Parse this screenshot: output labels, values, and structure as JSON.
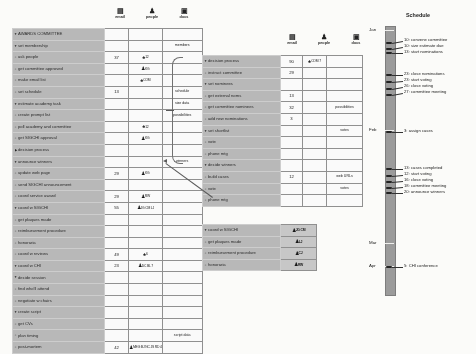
{
  "document": {
    "title": "AWARDS COMMITTEE project outline"
  },
  "columns": {
    "email": {
      "label": "email",
      "icon": "email-icon"
    },
    "people": {
      "label": "people",
      "icon": "people-icon"
    },
    "docs": {
      "label": "docs",
      "icon": "docs-icon"
    }
  },
  "main_panel": {
    "rows": [
      {
        "marker": "down",
        "indent": 0,
        "label": "AWARDS COMMITTEE",
        "email": "",
        "people": "",
        "docs": ""
      },
      {
        "marker": "down",
        "indent": 1,
        "label": "set membership",
        "email": "",
        "people": "",
        "docs": "members"
      },
      {
        "marker": "dot",
        "indent": 2,
        "label": "ask people",
        "email": "37",
        "people": "12",
        "people_icon": "group-icon",
        "docs": ""
      },
      {
        "marker": "dot",
        "indent": 2,
        "label": "get committee approved",
        "email": "",
        "people": "KG",
        "people_icon": "person-icon",
        "docs": ""
      },
      {
        "marker": "dot",
        "indent": 2,
        "label": "make email list",
        "email": "",
        "people": "COM",
        "people_icon": "group-icon",
        "docs": ""
      },
      {
        "marker": "dot",
        "indent": 1,
        "label": "set schedule",
        "email": "13",
        "people": "",
        "docs": "schedule"
      },
      {
        "marker": "down",
        "indent": 1,
        "label": "estimate academy task",
        "email": "",
        "people": "",
        "docs": "size data"
      },
      {
        "marker": "dot",
        "indent": 2,
        "label": "create prompt list",
        "email": "",
        "people": "",
        "docs": "possibilities"
      },
      {
        "marker": "dot",
        "indent": 2,
        "label": "poll academy and committee",
        "email": "",
        "people": "12",
        "people_icon": "group-icon",
        "docs": ""
      },
      {
        "marker": "dot",
        "indent": 2,
        "label": "get SIGCHI approval",
        "email": "",
        "people": "KG",
        "people_icon": "person-icon",
        "docs": ""
      },
      {
        "marker": "right",
        "indent": 1,
        "label": "decision process",
        "email": "",
        "people": "",
        "docs": ""
      },
      {
        "marker": "down",
        "indent": 1,
        "label": "announce winners",
        "email": "",
        "people": "",
        "docs": "winners"
      },
      {
        "marker": "dot",
        "indent": 2,
        "label": "update web page",
        "email": "29",
        "people": "KG",
        "people_icon": "person-icon",
        "docs": ""
      },
      {
        "marker": "dot",
        "indent": 2,
        "label": "send SIGCHI announcement",
        "email": "",
        "people": "",
        "docs": ""
      },
      {
        "marker": "dot",
        "indent": 1,
        "label": "coord service award",
        "email": "29",
        "people": "RW",
        "people_icon": "person-icon",
        "docs": ""
      },
      {
        "marker": "down",
        "indent": 1,
        "label": "coord w SIGCHI",
        "email": "55",
        "people": "JG CM LJ",
        "people_icon": "multi-icon",
        "docs": ""
      },
      {
        "marker": "dot",
        "indent": 2,
        "label": "get plaques made",
        "email": "",
        "people": "",
        "docs": ""
      },
      {
        "marker": "dot",
        "indent": 2,
        "label": "reimbursement procedure",
        "email": "",
        "people": "",
        "docs": ""
      },
      {
        "marker": "dot",
        "indent": 2,
        "label": "honoraria",
        "email": "",
        "people": "",
        "docs": ""
      },
      {
        "marker": "dot",
        "indent": 1,
        "label": "coord w reviews",
        "email": "49",
        "people": "6",
        "people_icon": "group-icon",
        "docs": ""
      },
      {
        "marker": "down",
        "indent": 1,
        "label": "coord w CHI",
        "email": "23",
        "people": "DC BL 7",
        "people_icon": "multi-icon",
        "docs": ""
      },
      {
        "marker": "down",
        "indent": 2,
        "label": "decide session",
        "email": "",
        "people": "",
        "docs": ""
      },
      {
        "marker": "dot",
        "indent": 3,
        "label": "find who'll attend",
        "email": "",
        "people": "",
        "docs": ""
      },
      {
        "marker": "dot",
        "indent": 3,
        "label": "negotiate w chairs",
        "email": "",
        "people": "",
        "docs": ""
      },
      {
        "marker": "down",
        "indent": 2,
        "label": "create script",
        "email": "",
        "people": "",
        "docs": ""
      },
      {
        "marker": "dot",
        "indent": 3,
        "label": "get CVs",
        "email": "",
        "people": "",
        "docs": ""
      },
      {
        "marker": "dot",
        "indent": 3,
        "label": "plan timing",
        "email": "",
        "people": "",
        "docs": "script data"
      },
      {
        "marker": "dot",
        "indent": 0,
        "label": "post-mortem",
        "email": "42",
        "people": "MEG BJ NC JS RD 4",
        "people_icon": "multi-icon",
        "docs": ""
      }
    ]
  },
  "detail_panel_decision": {
    "rows": [
      {
        "marker": "down",
        "indent": 0,
        "label": "decision process",
        "email": "90",
        "people": "COM 7",
        "people_icon": "group-icon",
        "docs": ""
      },
      {
        "marker": "dot",
        "indent": 1,
        "label": "instruct committee",
        "email": "29",
        "people": "",
        "docs": ""
      },
      {
        "marker": "down",
        "indent": 1,
        "label": "set nominees",
        "email": "",
        "people": "",
        "docs": ""
      },
      {
        "marker": "dot",
        "indent": 2,
        "label": "get external noms",
        "email": "13",
        "people": "",
        "docs": ""
      },
      {
        "marker": "dot",
        "indent": 2,
        "label": "get committee nominees",
        "email": "32",
        "people": "",
        "docs": "possibilities"
      },
      {
        "marker": "dot",
        "indent": 2,
        "label": "add new nominations",
        "email": "3",
        "people": "",
        "docs": ""
      },
      {
        "marker": "down",
        "indent": 1,
        "label": "set shortlist",
        "email": "",
        "people": "",
        "docs": "votes"
      },
      {
        "marker": "dot",
        "indent": 2,
        "label": "vote",
        "email": "",
        "people": "",
        "docs": ""
      },
      {
        "marker": "dot",
        "indent": 2,
        "label": "phone mtg",
        "email": "",
        "people": "",
        "docs": ""
      },
      {
        "marker": "down",
        "indent": 1,
        "label": "decide winners",
        "email": "",
        "people": "",
        "docs": ""
      },
      {
        "marker": "dot",
        "indent": 2,
        "label": "build cases",
        "email": "12",
        "people": "",
        "docs": "web URLs"
      },
      {
        "marker": "dot",
        "indent": 2,
        "label": "vote",
        "email": "",
        "people": "",
        "docs": "votes"
      },
      {
        "marker": "dot",
        "indent": 2,
        "label": "phone mtg",
        "email": "",
        "people": "",
        "docs": ""
      }
    ]
  },
  "detail_panel_sigchi": {
    "rows": [
      {
        "marker": "down",
        "indent": 0,
        "label": "coord w SIGCHI",
        "value": "JG CM"
      },
      {
        "marker": "dot",
        "indent": 1,
        "label": "get plaques made",
        "value": "LJ"
      },
      {
        "marker": "dot",
        "indent": 1,
        "label": "reimbursement procedure",
        "value": "CJ"
      },
      {
        "marker": "dot",
        "indent": 1,
        "label": "honoraria",
        "value": "RW"
      }
    ]
  },
  "schedule": {
    "title": "Schedule",
    "months": [
      "Jan",
      "Feb",
      "Mar",
      "Apr"
    ],
    "events": [
      {
        "month": "Jan",
        "day": "10",
        "text": "10: convene committee"
      },
      {
        "month": "Jan",
        "day": "10",
        "text": "10: size estimate due"
      },
      {
        "month": "Jan",
        "day": "13",
        "text": "13: start nominations"
      },
      {
        "month": "Jan",
        "day": "23",
        "text": "23: close nominations"
      },
      {
        "month": "Jan",
        "day": "23",
        "text": "23: start voting"
      },
      {
        "month": "Jan",
        "day": "26",
        "text": "26: close voting"
      },
      {
        "month": "Jan",
        "day": "27",
        "text": "27: committee meeting"
      },
      {
        "month": "Feb",
        "day": "3",
        "text": "3: assign cases"
      },
      {
        "month": "Feb",
        "day": "13",
        "text": "13: cases completed"
      },
      {
        "month": "Feb",
        "day": "12",
        "text": "12: start voting"
      },
      {
        "month": "Feb",
        "day": "16",
        "text": "16: close voting"
      },
      {
        "month": "Feb",
        "day": "18",
        "text": "18: committee meeting"
      },
      {
        "month": "Feb",
        "day": "20",
        "text": "20: announce winners"
      },
      {
        "month": "Apr",
        "day": "5",
        "text": "5: CHI conference"
      }
    ]
  }
}
